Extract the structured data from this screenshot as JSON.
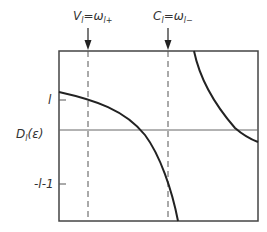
{
  "diagram": {
    "top_labels": {
      "valence": {
        "lhs": "V",
        "lhs_sub": "l",
        "eq": "=",
        "rhs": "ω",
        "rhs_sub": "l+"
      },
      "conduction": {
        "lhs": "C",
        "lhs_sub": "l",
        "eq": "=",
        "rhs": "ω",
        "rhs_sub": "l−"
      }
    },
    "y_axis": {
      "label": "D",
      "label_sub": "l",
      "label_arg": "(ε)",
      "ticks": [
        {
          "label": "l",
          "y": 100
        },
        {
          "label": "-l-1",
          "y": 184
        }
      ]
    },
    "frame": {
      "x": 59,
      "y": 51,
      "width": 199,
      "height": 170
    },
    "zero_line_y": 130,
    "dashed_lines": [
      {
        "name": "V_l",
        "x": 88
      },
      {
        "name": "C_l",
        "x": 168
      }
    ],
    "curves": [
      {
        "name": "lower-branch",
        "path": "M59,92 C95,100 125,110 145,135 C160,155 172,190 178,221"
      },
      {
        "name": "upper-branch",
        "path": "M194,51 C200,80 215,105 235,128 C243,135 250,139 258,142"
      }
    ],
    "colors": {
      "line": "#222222",
      "axis": "#555555"
    }
  }
}
